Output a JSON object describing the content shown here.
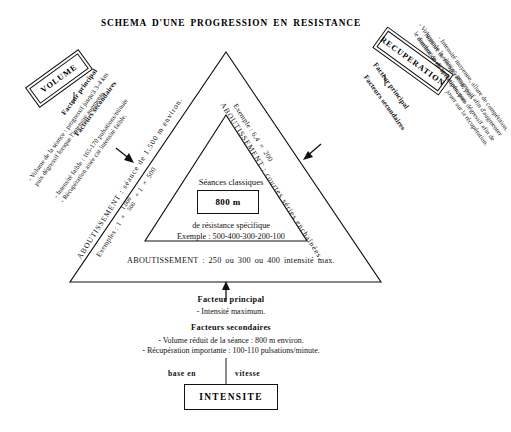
{
  "document": {
    "title": "SCHEMA D'UNE PROGRESSION EN RESISTANCE"
  },
  "volume_branch": {
    "box_label": "VOLUME",
    "primary_heading": "Facteur principal",
    "primary_lines": [
      "- Volume de la séance : progressif jusqu'à 3-4 km",
      "puis dégressif lorsque l'intensité augmente."
    ],
    "secondary_heading": "Facteurs secondaires",
    "secondary_lines": [
      "- Intensité faible : 165-170 pulsations/minute",
      "- Récupération aisée car intensité faible."
    ]
  },
  "recuperation_branch": {
    "box_label": "RECUPERATION",
    "primary_heading": "Facteur principal",
    "primary_lines": [
      "- Nombre de récupération, puis",
      "diminution de la récupération."
    ],
    "secondary_heading": "Facteurs secondaires",
    "secondary_lines": [
      "- Intensité moyenne, allure de compétition.",
      "- Volume de la séance : progressif afin d'augmenter",
      "le nombre de récupérations, puis dégressif afin de",
      "jouer sur la récupération."
    ]
  },
  "left_side_outcome": {
    "label": "ABOUTISSEMENT : séance de 1.500 m environ.",
    "example_prefix": "Exemples : 1",
    "multiply": "×",
    "fraction_top": "1.000",
    "fraction_bottom": "500",
    "example_suffix": "+ 1",
    "example_tail": "500"
  },
  "right_side_outcome": {
    "label": "ABOUTISSEMENT : courtes séries enchaînées.",
    "example": "Exemple : 6,4",
    "multiply": "×",
    "example_value": "200"
  },
  "inner_triangle": {
    "heading": "Séances classiques",
    "distance_box": "800 m",
    "subtitle": "de résistance spécifique",
    "example": "Exemple : 500-400-300-200-100"
  },
  "bottom_outcome": {
    "text": "ABOUTISSEMENT : 250 ou 300 ou 400 intensité max."
  },
  "intensity_block": {
    "primary_heading": "Facteur principal",
    "primary_line": "- Intensité maximum.",
    "secondary_heading": "Facteurs secondaires",
    "secondary_lines": [
      "- Volume réduit de la séance : 800 m environ.",
      "- Récupération importante : 100-110 pulsations/minute."
    ],
    "base_left": "base en",
    "base_right": "vitesse",
    "box_label": "INTENSITE"
  },
  "colors": {
    "ink": "#111111",
    "paper": "#ffffff"
  }
}
